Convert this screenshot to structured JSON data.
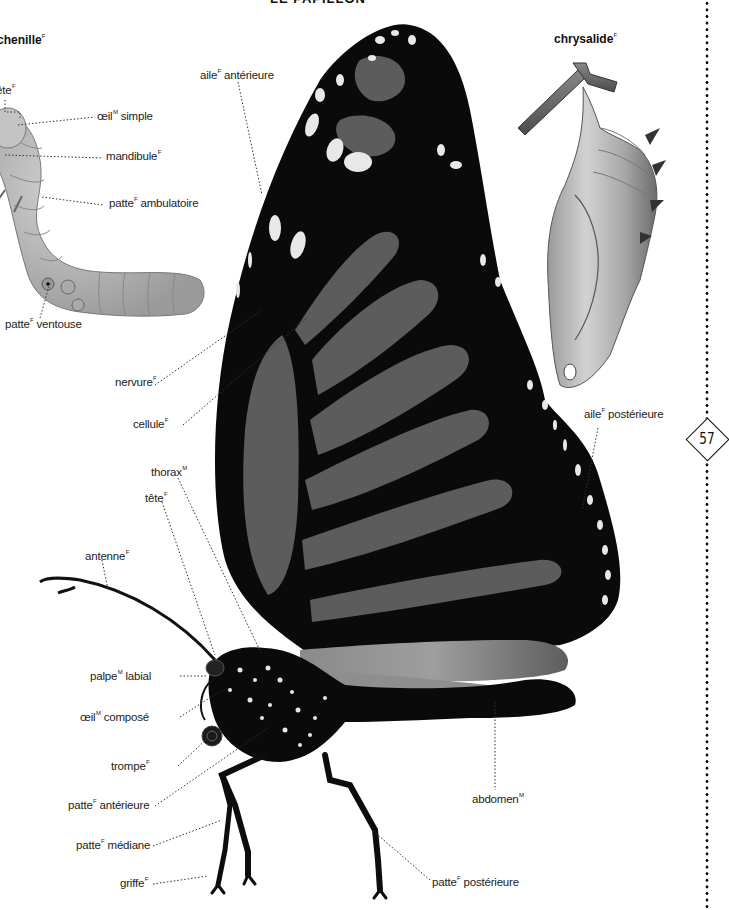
{
  "page": {
    "title": "LE PAPILLON",
    "page_number": "57"
  },
  "sections": {
    "caterpillar": {
      "title": "chenille",
      "gender": "F"
    },
    "chrysalis": {
      "title": "chrysalide",
      "gender": "F"
    }
  },
  "labels": {
    "caterpillar": [
      {
        "text": "tête",
        "gender": "F"
      },
      {
        "text": "œil",
        "gender": "M",
        "suffix": " simple"
      },
      {
        "text": "mandibule",
        "gender": "F"
      },
      {
        "text": "patte",
        "gender": "F",
        "suffix": " ambulatoire"
      },
      {
        "text": "patte",
        "gender": "F",
        "suffix": " ventouse"
      }
    ],
    "butterfly": [
      {
        "text": "aile",
        "gender": "F",
        "suffix": " antérieure"
      },
      {
        "text": "nervure",
        "gender": "F"
      },
      {
        "text": "cellule",
        "gender": "F"
      },
      {
        "text": "thorax",
        "gender": "M"
      },
      {
        "text": "tête",
        "gender": "F"
      },
      {
        "text": "antenne",
        "gender": "F"
      },
      {
        "text": "palpe",
        "gender": "M",
        "suffix": " labial"
      },
      {
        "text": "œil",
        "gender": "M",
        "suffix": " composé"
      },
      {
        "text": "trompe",
        "gender": "F"
      },
      {
        "text": "patte",
        "gender": "F",
        "suffix": " antérieure"
      },
      {
        "text": "patte",
        "gender": "F",
        "suffix": " médiane"
      },
      {
        "text": "griffe",
        "gender": "F"
      },
      {
        "text": "aile",
        "gender": "F",
        "suffix": " postérieure"
      },
      {
        "text": "abdomen",
        "gender": "M"
      },
      {
        "text": "patte",
        "gender": "F",
        "suffix": " postérieure"
      }
    ]
  },
  "colors": {
    "wing_black": "#0a0a0a",
    "wing_cell_gray": "#5a5a5a",
    "spot_white": "#e8e8e8",
    "caterpillar_gray": "#b4b4b4",
    "chrysalis_gray": "#bdbdbd",
    "leader_line": "#333333"
  }
}
